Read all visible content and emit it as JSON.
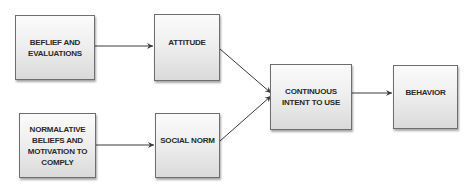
{
  "diagram": {
    "type": "flowchart",
    "nodes": [
      {
        "id": "beliefs",
        "label": "BEFLIEF AND EVALUATIONS"
      },
      {
        "id": "attitude",
        "label": "ATTITUDE"
      },
      {
        "id": "normative",
        "label": "NORMALATIVE BELIEFS AND MOTIVATION TO COMPLY"
      },
      {
        "id": "social_norm",
        "label": "SOCIAL NORM"
      },
      {
        "id": "intent",
        "label": "CONTINUOUS INTENT TO USE"
      },
      {
        "id": "behavior",
        "label": "BEHAVIOR"
      }
    ],
    "edges": [
      {
        "from": "beliefs",
        "to": "attitude"
      },
      {
        "from": "normative",
        "to": "social_norm"
      },
      {
        "from": "attitude",
        "to": "intent"
      },
      {
        "from": "social_norm",
        "to": "intent"
      },
      {
        "from": "intent",
        "to": "behavior"
      }
    ]
  },
  "labels": {
    "beliefs": "BEFLIEF AND EVALUATIONS",
    "attitude": "ATTITUDE",
    "normative": "NORMALATIVE BELIEFS AND MOTIVATION TO COMPLY",
    "social_norm": "SOCIAL NORM",
    "intent": "CONTINUOUS INTENT TO USE",
    "behavior": "BEHAVIOR"
  },
  "colors": {
    "box_border": "#6e6e6e",
    "text": "#2a2a2a",
    "arrow": "#3a3a3a"
  }
}
